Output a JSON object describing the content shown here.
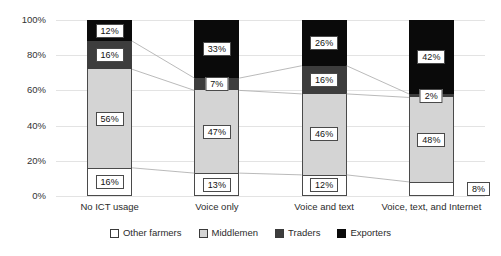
{
  "chart_data": {
    "type": "bar",
    "stacked": true,
    "title": "",
    "subtitle": "",
    "xlabel": "",
    "ylabel": "",
    "ylim": [
      0,
      100
    ],
    "ytick_labels": [
      "0%",
      "20%",
      "40%",
      "60%",
      "80%",
      "100%"
    ],
    "ytick_values": [
      0,
      20,
      40,
      60,
      80,
      100
    ],
    "grid": true,
    "legend_position": "bottom",
    "categories": [
      "No ICT usage",
      "Voice only",
      "Voice and text",
      "Voice, text, and Internet"
    ],
    "series": [
      {
        "name": "Other farmers",
        "color": "#ffffff",
        "values": [
          16,
          13,
          12,
          8
        ]
      },
      {
        "name": "Middlemen",
        "color": "#d4d4d4",
        "values": [
          56,
          47,
          46,
          48
        ]
      },
      {
        "name": "Traders",
        "color": "#3d3d3d",
        "values": [
          16,
          7,
          16,
          2
        ]
      },
      {
        "name": "Exporters",
        "color": "#0a0a0a",
        "values": [
          12,
          33,
          26,
          42
        ]
      }
    ],
    "data_labels": [
      [
        "16%",
        "56%",
        "16%",
        "12%"
      ],
      [
        "13%",
        "47%",
        "7%",
        "33%"
      ],
      [
        "12%",
        "46%",
        "16%",
        "26%"
      ],
      [
        "8%",
        "48%",
        "2%",
        "42%"
      ]
    ],
    "connector_lines": true
  },
  "legend": {
    "items": [
      {
        "label": "Other farmers",
        "swatch": "other"
      },
      {
        "label": "Middlemen",
        "swatch": "middle"
      },
      {
        "label": "Traders",
        "swatch": "trader"
      },
      {
        "label": "Exporters",
        "swatch": "export"
      }
    ]
  }
}
